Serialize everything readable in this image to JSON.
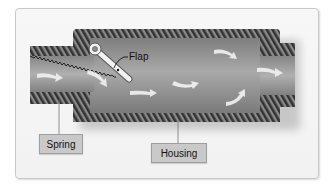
{
  "diagram": {
    "type": "cross-section",
    "labels": {
      "flap": "Flap",
      "spring": "Spring",
      "housing": "Housing"
    },
    "colors": {
      "hatch_dark": "#3a3a3a",
      "hatch_light": "#8a8a8a",
      "interior": "#8f8f8f",
      "arrow": "#f2f2f2",
      "label_bg": "#c9c9c9",
      "card_bg": "#f4f4f4"
    },
    "flow_arrows": 7
  }
}
